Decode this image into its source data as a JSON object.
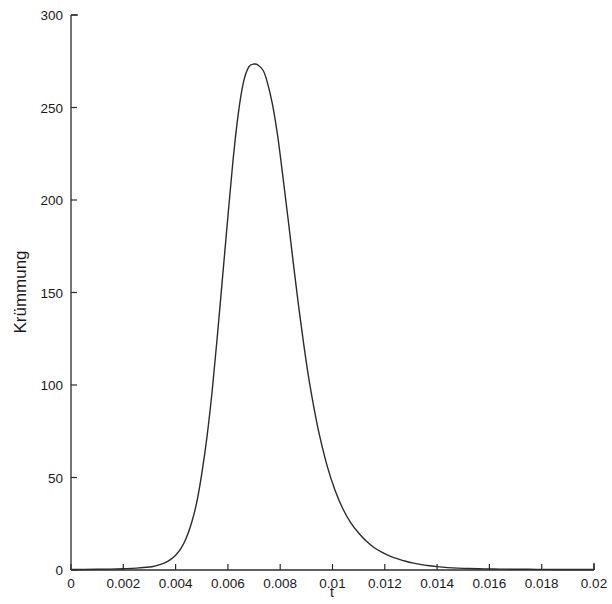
{
  "chart_data": {
    "type": "line",
    "title": "",
    "subtitle": "",
    "xlabel": "t",
    "ylabel": "Krümmung",
    "xlim": [
      0,
      0.02
    ],
    "ylim": [
      0,
      300
    ],
    "grid": false,
    "legend": null,
    "legend_position": "none",
    "xticks": [
      0,
      0.002,
      0.004,
      0.006,
      0.008,
      0.01,
      0.012,
      0.014,
      0.016,
      0.018,
      0.02
    ],
    "xtick_labels": [
      "0",
      "0.002",
      "0.004",
      "0.006",
      "0.008",
      "0.01",
      "0.012",
      "0.014",
      "0.016",
      "0.018",
      "0.02"
    ],
    "yticks": [
      0,
      50,
      100,
      150,
      200,
      250,
      300
    ],
    "ytick_labels": [
      "0",
      "50",
      "100",
      "150",
      "200",
      "250",
      "300"
    ],
    "series": [
      {
        "name": "Krümmung",
        "color": "#2b2b2b",
        "linewidth": 1.4,
        "x": [
          0,
          0.0005,
          0.001,
          0.0015,
          0.002,
          0.0025,
          0.003,
          0.0032,
          0.0034,
          0.0036,
          0.0038,
          0.004,
          0.0042,
          0.0044,
          0.0046,
          0.0048,
          0.005,
          0.0052,
          0.0054,
          0.0056,
          0.0058,
          0.006,
          0.0062,
          0.0064,
          0.0066,
          0.0068,
          0.007,
          0.00715,
          0.00735,
          0.0075,
          0.0077,
          0.0079,
          0.0081,
          0.0083,
          0.0085,
          0.0087,
          0.0089,
          0.0091,
          0.0093,
          0.0095,
          0.0098,
          0.0101,
          0.0104,
          0.0107,
          0.011,
          0.0113,
          0.0116,
          0.0119,
          0.0122,
          0.0125,
          0.0128,
          0.0131,
          0.0134,
          0.0137,
          0.014,
          0.0144,
          0.0148,
          0.0152,
          0.0158,
          0.0164,
          0.017,
          0.0178,
          0.0186,
          0.0194,
          0.02
        ],
        "y": [
          0.3,
          0.3,
          0.4,
          0.5,
          0.7,
          1.0,
          1.6,
          2.1,
          2.9,
          4.0,
          5.6,
          8.0,
          11.5,
          17,
          25,
          36,
          52,
          72,
          97,
          127,
          159,
          191,
          222,
          247,
          264,
          272,
          273.5,
          273,
          270,
          264,
          252,
          235,
          213,
          190,
          166,
          143,
          122,
          103,
          87,
          73,
          56,
          43,
          33,
          25.5,
          20,
          15.5,
          12,
          9.5,
          7.5,
          6,
          4.7,
          3.7,
          2.9,
          2.3,
          1.8,
          1.3,
          1.0,
          0.8,
          0.6,
          0.5,
          0.4,
          0.35,
          0.3,
          0.3,
          0.3
        ],
        "peak": {
          "t": 0.00735,
          "value": 273.5
        }
      }
    ]
  },
  "axes": {
    "spine_color": "#2b2b2b",
    "background": "#ffffff",
    "tick_direction": "in"
  }
}
